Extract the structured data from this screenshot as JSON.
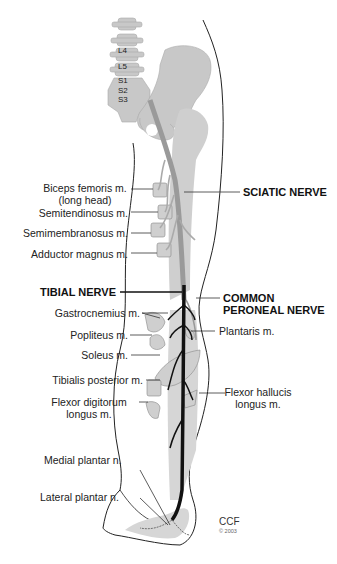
{
  "figure": {
    "vertebrae": [
      "L4",
      "L5",
      "S1",
      "S2",
      "S3"
    ],
    "left_labels": [
      {
        "id": "biceps",
        "lines": [
          "Biceps femoris m.",
          "(long head)"
        ]
      },
      {
        "id": "semitendinosus",
        "lines": [
          "Semitendinosus m."
        ]
      },
      {
        "id": "semimembranosus",
        "lines": [
          "Semimembranosus m."
        ]
      },
      {
        "id": "adductor",
        "lines": [
          "Adductor magnus m."
        ]
      },
      {
        "id": "tibial",
        "lines": [
          "TIBIAL NERVE"
        ]
      },
      {
        "id": "gastrocnemius",
        "lines": [
          "Gastrocnemius m."
        ]
      },
      {
        "id": "popliteus",
        "lines": [
          "Popliteus m."
        ]
      },
      {
        "id": "soleus",
        "lines": [
          "Soleus m."
        ]
      },
      {
        "id": "tibialis_posterior",
        "lines": [
          "Tibialis posterior m."
        ]
      },
      {
        "id": "flexor_digitorum",
        "lines": [
          "Flexor digitorum",
          "longus m."
        ]
      },
      {
        "id": "medial_plantar",
        "lines": [
          "Medial plantar n."
        ]
      },
      {
        "id": "lateral_plantar",
        "lines": [
          "Lateral plantar n."
        ]
      }
    ],
    "right_labels": [
      {
        "id": "sciatic",
        "lines": [
          "SCIATIC NERVE"
        ]
      },
      {
        "id": "common_peroneal",
        "lines": [
          "COMMON",
          "PERONEAL NERVE"
        ]
      },
      {
        "id": "plantaris",
        "lines": [
          "Plantaris m."
        ]
      },
      {
        "id": "flexor_hallucis",
        "lines": [
          "Flexor hallucis",
          "longus m."
        ]
      }
    ],
    "credit": {
      "org": "CCF",
      "copyright": "© 2003"
    },
    "colors": {
      "bone": "#c8c8c8",
      "muscle": "#cfcfcf",
      "nerve_gray": "#9a9a9a",
      "nerve_black": "#111111",
      "outline": "#222222"
    }
  }
}
